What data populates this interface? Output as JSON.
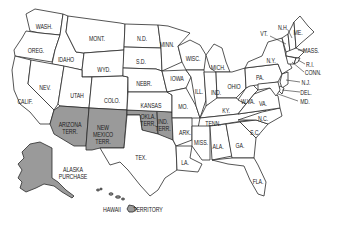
{
  "map": {
    "title": "",
    "colors": {
      "territory_fill": "#9a9a9a",
      "state_fill": "#ffffff",
      "border": "#2a2a2a"
    },
    "labels": [
      {
        "id": "wash",
        "text": "WASH.",
        "x": 44,
        "y": 26
      },
      {
        "id": "oreg",
        "text": "OREG.",
        "x": 36,
        "y": 50
      },
      {
        "id": "idaho",
        "text": "IDAHO",
        "x": 66,
        "y": 59
      },
      {
        "id": "mont",
        "text": "MONT.",
        "x": 97,
        "y": 38
      },
      {
        "id": "wyo",
        "text": "WYD.",
        "x": 104,
        "y": 69
      },
      {
        "id": "nev",
        "text": "NEV.",
        "x": 45,
        "y": 87
      },
      {
        "id": "utah",
        "text": "UTAH",
        "x": 77,
        "y": 95
      },
      {
        "id": "colo",
        "text": "COLO.",
        "x": 112,
        "y": 100
      },
      {
        "id": "calif",
        "text": "CALIF.",
        "x": 25,
        "y": 101
      },
      {
        "id": "nd",
        "text": "N.D.",
        "x": 142,
        "y": 38
      },
      {
        "id": "sd",
        "text": "S.D.",
        "x": 141,
        "y": 61
      },
      {
        "id": "nebr",
        "text": "NEBR.",
        "x": 144,
        "y": 83
      },
      {
        "id": "kansas",
        "text": "KANSAS",
        "x": 151,
        "y": 105
      },
      {
        "id": "minn",
        "text": "MINN.",
        "x": 167,
        "y": 44
      },
      {
        "id": "iowa",
        "text": "IOWA",
        "x": 177,
        "y": 78
      },
      {
        "id": "wisc",
        "text": "WISC.",
        "x": 193,
        "y": 58
      },
      {
        "id": "mich",
        "text": "MICH.",
        "x": 218,
        "y": 67
      },
      {
        "id": "ill",
        "text": "ILL.",
        "x": 199,
        "y": 91
      },
      {
        "id": "ind",
        "text": "IND.",
        "x": 216,
        "y": 92
      },
      {
        "id": "ohio",
        "text": "OHIO",
        "x": 234,
        "y": 86
      },
      {
        "id": "mo",
        "text": "MO.",
        "x": 183,
        "y": 106
      },
      {
        "id": "ky",
        "text": "KY.",
        "x": 226,
        "y": 110
      },
      {
        "id": "wva",
        "text": "W.VA.",
        "x": 248,
        "y": 101
      },
      {
        "id": "va",
        "text": "VA.",
        "x": 263,
        "y": 103
      },
      {
        "id": "pa",
        "text": "PA.",
        "x": 260,
        "y": 77
      },
      {
        "id": "ny",
        "text": "N.Y.",
        "x": 271,
        "y": 60
      },
      {
        "id": "vt",
        "text": "VT.",
        "x": 264,
        "y": 33
      },
      {
        "id": "nh",
        "text": "N.H.",
        "x": 283,
        "y": 27
      },
      {
        "id": "me",
        "text": "ME.",
        "x": 298,
        "y": 32
      },
      {
        "id": "mass",
        "text": "MASS.",
        "x": 311,
        "y": 50
      },
      {
        "id": "ri",
        "text": "R.I.",
        "x": 310,
        "y": 64
      },
      {
        "id": "conn",
        "text": "CONN.",
        "x": 313,
        "y": 72
      },
      {
        "id": "nj",
        "text": "N.J.",
        "x": 306,
        "y": 82
      },
      {
        "id": "del",
        "text": "DEL.",
        "x": 306,
        "y": 92
      },
      {
        "id": "md",
        "text": "MD.",
        "x": 305,
        "y": 101
      },
      {
        "id": "tenn",
        "text": "TENN.",
        "x": 213,
        "y": 123
      },
      {
        "id": "nc",
        "text": "N.C.",
        "x": 263,
        "y": 118
      },
      {
        "id": "sc",
        "text": "S.C.",
        "x": 255,
        "y": 132
      },
      {
        "id": "ark",
        "text": "ARK.",
        "x": 185,
        "y": 132
      },
      {
        "id": "miss",
        "text": "MISS.",
        "x": 201,
        "y": 142
      },
      {
        "id": "ala",
        "text": "ALA.",
        "x": 218,
        "y": 146
      },
      {
        "id": "ga",
        "text": "GA.",
        "x": 240,
        "y": 145
      },
      {
        "id": "la",
        "text": "LA.",
        "x": 185,
        "y": 162
      },
      {
        "id": "fla",
        "text": "FLA.",
        "x": 258,
        "y": 181
      },
      {
        "id": "tex",
        "text": "TEX.",
        "x": 141,
        "y": 157
      },
      {
        "id": "ariz",
        "text": "ARIZONA\nTERR.",
        "x": 70,
        "y": 128
      },
      {
        "id": "nm",
        "text": "NEW\nMEXICO\nTERR.",
        "x": 103,
        "y": 134
      },
      {
        "id": "okla",
        "text": "OKLA.\nTERR.",
        "x": 148,
        "y": 120
      },
      {
        "id": "indterr",
        "text": "IND.\nTERR.",
        "x": 163,
        "y": 125
      },
      {
        "id": "alaska",
        "text": "ALASKA\nPURCHASE",
        "x": 73,
        "y": 173
      },
      {
        "id": "hawaii",
        "text": "HAWAII",
        "x": 112,
        "y": 209
      },
      {
        "id": "hawterr",
        "text": "TERRITORY",
        "x": 148,
        "y": 209
      }
    ]
  }
}
